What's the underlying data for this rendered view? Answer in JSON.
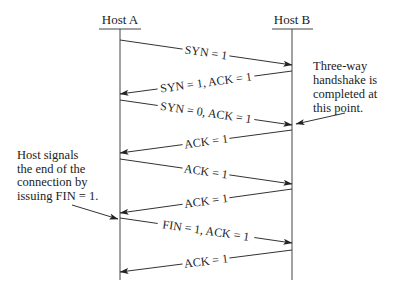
{
  "diagram": {
    "hosts": [
      {
        "id": "A",
        "label": "Host A",
        "x": 120
      },
      {
        "id": "B",
        "label": "Host B",
        "x": 292
      }
    ],
    "lifeline": {
      "top": 30,
      "bottom": 280
    },
    "messages": [
      {
        "label": "SYN = 1",
        "from": "A",
        "to": "B",
        "y1": 40,
        "y2": 65,
        "italic_one": true
      },
      {
        "label": "SYN = 1, ACK = 1",
        "from": "B",
        "to": "A",
        "y1": 71,
        "y2": 94,
        "italic_one": false
      },
      {
        "label": "SYN = 0, ACK = 1",
        "from": "A",
        "to": "B",
        "y1": 100,
        "y2": 125,
        "italic_one": true
      },
      {
        "label": "ACK = 1",
        "from": "B",
        "to": "A",
        "y1": 130,
        "y2": 153,
        "italic_one": false
      },
      {
        "label": "ACK = 1",
        "from": "A",
        "to": "B",
        "y1": 159,
        "y2": 184,
        "italic_one": true
      },
      {
        "label": "ACK = 1",
        "from": "B",
        "to": "A",
        "y1": 189,
        "y2": 213,
        "italic_one": false
      },
      {
        "label": "FIN = 1, ACK = 1",
        "from": "A",
        "to": "B",
        "y1": 218,
        "y2": 243,
        "italic_one": true
      },
      {
        "label": "ACK = 1",
        "from": "B",
        "to": "A",
        "y1": 250,
        "y2": 272,
        "italic_one": false
      }
    ],
    "annotations": [
      {
        "id": "handshake-note",
        "lines": [
          "Three-way",
          "handshake is",
          "completed at",
          "this point."
        ],
        "x": 313,
        "y": 70,
        "line_height": 14,
        "arrow": {
          "x1": 345,
          "y1": 113,
          "x2": 296,
          "y2": 124
        }
      },
      {
        "id": "fin-note",
        "lines": [
          "Host signals",
          "the end of the",
          "connection by",
          "issuing FIN = 1."
        ],
        "x": 17,
        "y": 159,
        "line_height": 13.5,
        "arrow": {
          "x1": 72,
          "y1": 205,
          "x2": 118,
          "y2": 219
        }
      }
    ],
    "colors": {
      "ink": "#333333",
      "background": "#ffffff"
    }
  }
}
